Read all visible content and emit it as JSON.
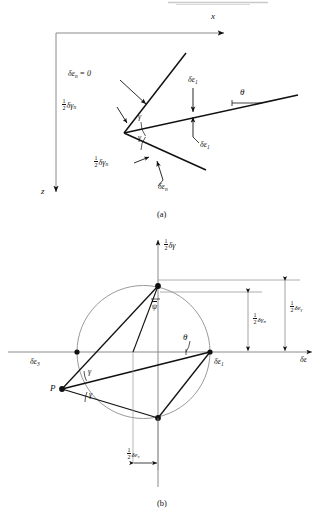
{
  "figure": {
    "title_bar_artifact": "",
    "panels": [
      {
        "id": "a",
        "caption": "(a)",
        "axes": {
          "x_label": "x",
          "z_label": "z"
        },
        "labels": {
          "zero_extension": "δε",
          "zero_extension_sub": "n",
          "zero_extension_eq": " = 0",
          "half_gamma_n_upper": "δγ",
          "half_gamma_n_upper_sub": "n",
          "half_gamma_n_lower": "δγ",
          "half_gamma_n_lower_sub": "n",
          "gamma_upper": "γ",
          "gamma_lower": "γ",
          "eps1_upper": "δε",
          "eps1_upper_sub": "1",
          "eps1_lower": "δε",
          "eps1_lower_sub": "1",
          "theta": "θ",
          "eps_n_lower": "δε",
          "eps_n_lower_sub": "n",
          "half": "1/2"
        }
      },
      {
        "id": "b",
        "caption": "(b)",
        "axes": {
          "vertical_label": "δγ",
          "vertical_label_frac": "1/2",
          "horizontal_label": "δε"
        },
        "points": {
          "p_label": "P",
          "eps3_label": "δε",
          "eps3_sub": "3",
          "eps1_label": "δε",
          "eps1_sub": "1"
        },
        "angles": {
          "psi_bar": "ψ",
          "theta": "θ",
          "gamma_upper": "γ",
          "gamma_lower": "γ"
        },
        "dimensions": {
          "half_dgamma_n": "δγ",
          "half_dgamma_n_sub": "n",
          "half_deps_gamma": "δε",
          "half_deps_gamma_sub": "γ",
          "half_deps_v": "δε",
          "half_deps_v_sub": "v",
          "half": "1/2"
        }
      }
    ]
  },
  "colors": {
    "ink": "#111111",
    "thin_line": "#8a8a8a",
    "circle": "#9a9a9a",
    "background": "#ffffff"
  }
}
